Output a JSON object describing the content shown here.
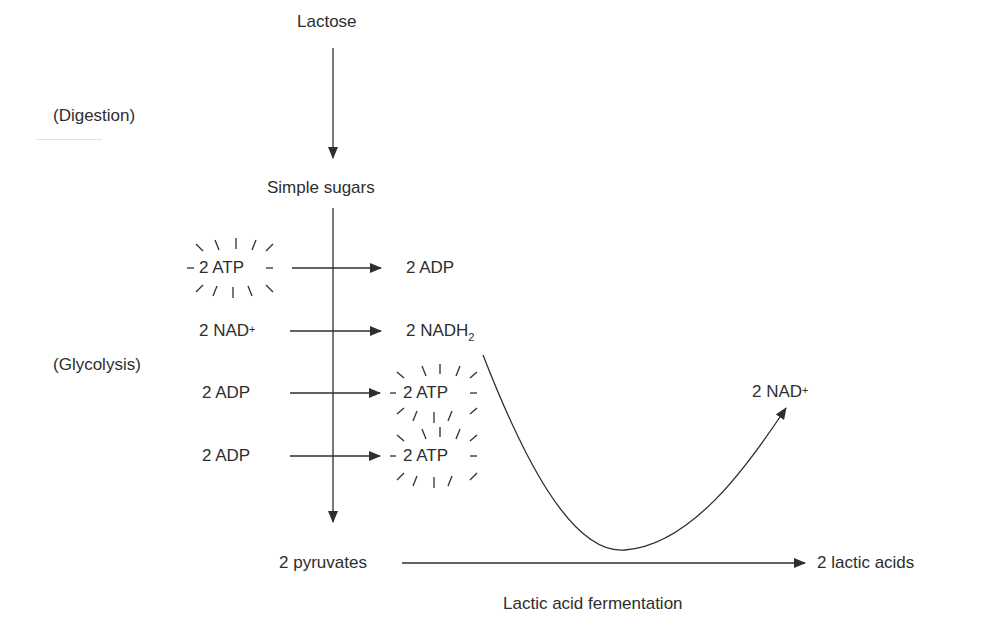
{
  "diagram": {
    "stages": {
      "digestion_label": "(Digestion)",
      "glycolysis_label": "(Glycolysis)",
      "fermentation_label": "Lactic acid fermentation"
    },
    "nodes": {
      "lactose": "Lactose",
      "simple_sugars": "Simple sugars",
      "pyruvates": "2 pyruvates",
      "lactic_acids": "2 lactic acids"
    },
    "glycolysis_steps": [
      {
        "input": "2 ATP",
        "output": "2 ADP",
        "input_starburst": true,
        "output_starburst": false
      },
      {
        "input_base": "2 NAD",
        "input_sup": "+",
        "output_base": "2 NADH",
        "output_sub": "2"
      },
      {
        "input": "2 ADP",
        "output": "2 ATP",
        "input_starburst": false,
        "output_starburst": true
      },
      {
        "input": "2 ADP",
        "output": "2 ATP",
        "input_starburst": false,
        "output_starburst": true
      }
    ],
    "regenerated": {
      "base": "2 NAD",
      "sup": "+"
    },
    "colors": {
      "ink": "#2e2e2e",
      "background": "#ffffff"
    }
  }
}
